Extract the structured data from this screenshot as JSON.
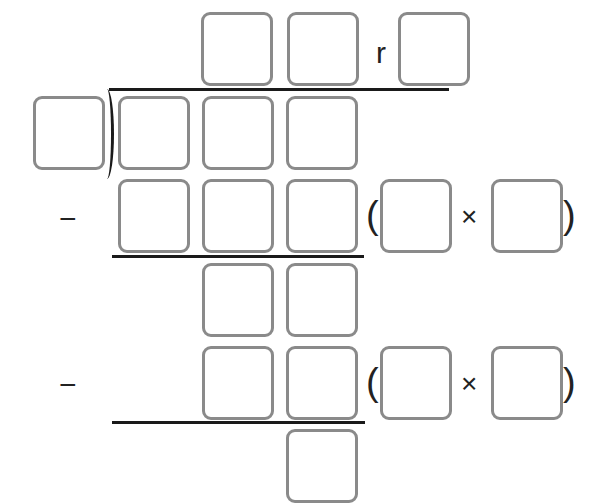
{
  "problem": {
    "type": "long-division-template",
    "remainder_label": "r",
    "minus_sign": "−",
    "open_paren": "(",
    "close_paren": ")",
    "times_sign": "×"
  },
  "boxes": {
    "quotient": [
      "",
      ""
    ],
    "remainder": "",
    "divisor": "",
    "dividend": [
      "",
      "",
      ""
    ],
    "subtract_1": [
      "",
      "",
      ""
    ],
    "subtract_1_factors": [
      "",
      ""
    ],
    "difference_1": [
      "",
      ""
    ],
    "subtract_2": [
      "",
      ""
    ],
    "subtract_2_factors": [
      "",
      ""
    ],
    "difference_2": [
      ""
    ]
  },
  "colors": {
    "box_border": "#8a8a8a",
    "line": "#1a1a1a",
    "text": "#222222"
  }
}
